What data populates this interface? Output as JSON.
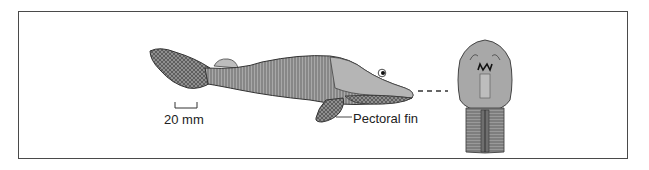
{
  "figure": {
    "scale_bar": {
      "label": "20 mm"
    },
    "annotations": [
      {
        "id": "pectoral-fin",
        "label": "Pectoral fin"
      }
    ],
    "views": [
      {
        "id": "lateral",
        "description": "lateral view of fossil fish"
      },
      {
        "id": "anterior",
        "description": "ventral/anterior view of head"
      }
    ],
    "colors": {
      "body_fill": "#a9a9a9",
      "body_light": "#c4c4c4",
      "outline": "#3a3a3a",
      "frame": "#4a4a4a",
      "text": "#222222"
    }
  }
}
